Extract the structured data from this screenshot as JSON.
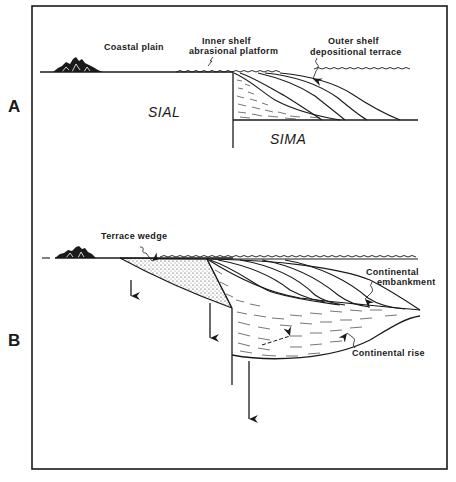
{
  "figure": {
    "panels": [
      {
        "id": "A",
        "label": "A",
        "annotations": {
          "coastal_plain": "Coastal plain",
          "inner_shelf_line1": "Inner shelf",
          "inner_shelf_line2": "abrasional platform",
          "outer_shelf_line1": "Outer shelf",
          "outer_shelf_line2": "depositional terrace",
          "sial": "SIAL",
          "sima": "SIMA"
        }
      },
      {
        "id": "B",
        "label": "B",
        "annotations": {
          "terrace_wedge": "Terrace wedge",
          "continental_embankment_line1": "Continental",
          "continental_embankment_line2": "embankment",
          "continental_rise": "Continental  rise"
        }
      }
    ],
    "colors": {
      "ink": "#1a1a1a",
      "background": "#ffffff"
    }
  }
}
